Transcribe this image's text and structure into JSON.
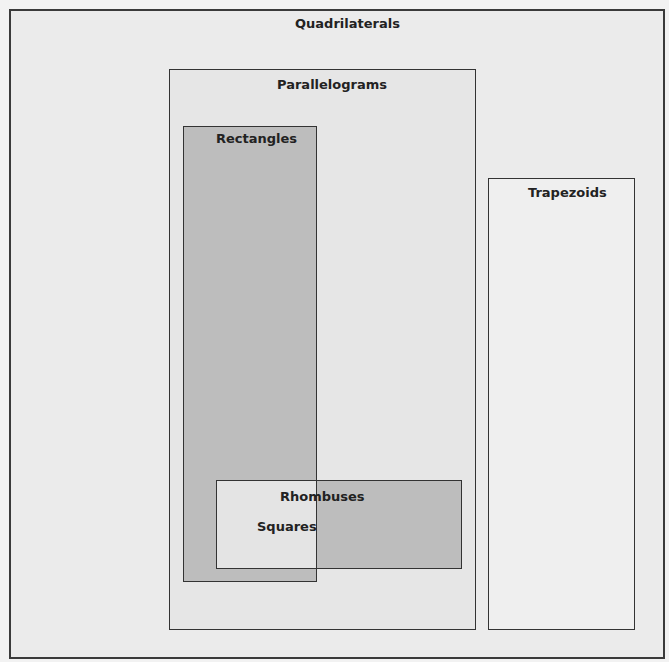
{
  "diagram": {
    "title": "Quadrilaterals",
    "sets": [
      {
        "id": "quadrilaterals",
        "label": "Quadrilaterals"
      },
      {
        "id": "parallelograms",
        "label": "Parallelograms",
        "parent": "quadrilaterals"
      },
      {
        "id": "trapezoids",
        "label": "Trapezoids",
        "parent": "quadrilaterals"
      },
      {
        "id": "rectangles",
        "label": "Rectangles",
        "parent": "parallelograms"
      },
      {
        "id": "rhombuses",
        "label": "Rhombuses",
        "parent": "parallelograms"
      },
      {
        "id": "squares",
        "label": "Squares",
        "intersection_of": [
          "rectangles",
          "rhombuses"
        ]
      }
    ],
    "labels": {
      "quadrilaterals": "Quadrilaterals",
      "parallelograms": "Parallelograms",
      "trapezoids": "Trapezoids",
      "rectangles": "Rectangles",
      "rhombuses": "Rhombuses",
      "squares": "Squares"
    },
    "colors": {
      "background": "#f2f2f2",
      "shaded": "#bdbdbd",
      "light": "#e6e6e6",
      "border": "#333333"
    }
  }
}
